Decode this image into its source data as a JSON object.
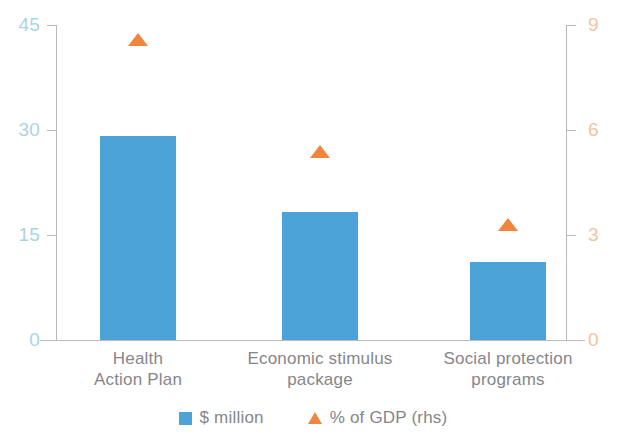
{
  "chart_data": {
    "type": "bar",
    "title": "",
    "subtitle": "",
    "xlabel": "",
    "ylabel": "",
    "y2label": "",
    "grid": false,
    "legend_position": "bottom-center",
    "categories": [
      "Health\nAction Plan",
      "Economic stimulus\npackage",
      "Social protection\nprograms"
    ],
    "category_lines": [
      [
        "Health",
        "Action Plan"
      ],
      [
        "Economic stimulus",
        "package"
      ],
      [
        "Social protection",
        "programs"
      ]
    ],
    "series": [
      {
        "name": "$ million",
        "type": "bar",
        "axis": "left",
        "color": "#4ba3d7",
        "values": [
          29.1,
          18.3,
          11.1
        ]
      },
      {
        "name": "% of GDP (rhs)",
        "type": "scatter",
        "marker": "triangle-up",
        "axis": "right",
        "color": "#f0863e",
        "values": [
          8.6,
          5.4,
          3.3
        ]
      }
    ],
    "ylim": [
      0,
      45
    ],
    "yticks": [
      "0",
      "15",
      "30",
      "45"
    ],
    "ytick_values": [
      0,
      15,
      30,
      45
    ],
    "y2lim": [
      0,
      9
    ],
    "y2ticks": [
      "0",
      "3",
      "6",
      "9"
    ],
    "y2tick_values": [
      0,
      3,
      6,
      9
    ]
  },
  "legend": {
    "items": [
      {
        "label": "$ million",
        "marker": "square-icon",
        "color": "#4ba3d7"
      },
      {
        "label": "% of GDP (rhs)",
        "marker": "triangle-up-icon",
        "color": "#f0863e"
      }
    ]
  },
  "colors": {
    "bar": "#4ba3d7",
    "marker": "#f0863e",
    "left_axis_text": "#a9d4e8",
    "right_axis_text": "#f3c3a0",
    "category_text": "#86868a",
    "axis_line": "#b9b9b9",
    "background": "#ffffff"
  }
}
